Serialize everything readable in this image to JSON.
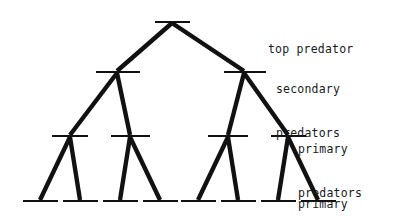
{
  "figure": {
    "kind": "trophic-pyramid-food-web-diagram",
    "background_color": "#ffffff",
    "ink_color": "#111111",
    "width": 419,
    "height": 216
  },
  "labels": {
    "top_predator": {
      "line1": "top predator"
    },
    "secondary_predators": {
      "line1": "secondary",
      "line2": "predators"
    },
    "primary_predators": {
      "line1": "primary",
      "line2": "predators"
    },
    "primary_producers": {
      "line1": "primary",
      "line2": "producers"
    }
  },
  "chart_data": {
    "type": "diagram",
    "title": "",
    "levels": [
      {
        "name": "top predator",
        "index": 0,
        "y": 22,
        "node_count": 1,
        "nodes": [
          {
            "id": "T1",
            "x_center": 172,
            "bar_x1": 155,
            "bar_x2": 190
          }
        ]
      },
      {
        "name": "secondary predators",
        "index": 1,
        "y": 72,
        "node_count": 2,
        "nodes": [
          {
            "id": "S1",
            "x_center": 117,
            "bar_x1": 96,
            "bar_x2": 140
          },
          {
            "id": "S2",
            "x_center": 244,
            "bar_x1": 224,
            "bar_x2": 266
          }
        ]
      },
      {
        "name": "primary predators",
        "index": 2,
        "y": 136,
        "node_count": 4,
        "nodes": [
          {
            "id": "P1",
            "x_center": 70,
            "bar_x1": 52,
            "bar_x2": 88
          },
          {
            "id": "P2",
            "x_center": 130,
            "bar_x1": 111,
            "bar_x2": 150
          },
          {
            "id": "P3",
            "x_center": 228,
            "bar_x1": 208,
            "bar_x2": 248
          },
          {
            "id": "P4",
            "x_center": 288,
            "bar_x1": 271,
            "bar_x2": 306
          }
        ]
      },
      {
        "name": "primary producers",
        "index": 3,
        "y": 201,
        "node_count": 8,
        "nodes": [
          {
            "id": "B1",
            "x_center": 40,
            "bar_x1": 23,
            "bar_x2": 58
          },
          {
            "id": "B2",
            "x_center": 80,
            "bar_x1": 63,
            "bar_x2": 98
          },
          {
            "id": "B3",
            "x_center": 120,
            "bar_x1": 103,
            "bar_x2": 138
          },
          {
            "id": "B4",
            "x_center": 160,
            "bar_x1": 143,
            "bar_x2": 178
          },
          {
            "id": "B5",
            "x_center": 198,
            "bar_x1": 181,
            "bar_x2": 216
          },
          {
            "id": "B6",
            "x_center": 238,
            "bar_x1": 221,
            "bar_x2": 256
          },
          {
            "id": "B7",
            "x_center": 278,
            "bar_x1": 261,
            "bar_x2": 296
          },
          {
            "id": "B8",
            "x_center": 318,
            "bar_x1": 301,
            "bar_x2": 336
          }
        ]
      }
    ],
    "edges": [
      {
        "from": "T1",
        "to": "S1"
      },
      {
        "from": "T1",
        "to": "S2"
      },
      {
        "from": "S1",
        "to": "P1"
      },
      {
        "from": "S1",
        "to": "P2"
      },
      {
        "from": "S2",
        "to": "P3"
      },
      {
        "from": "S2",
        "to": "P4"
      },
      {
        "from": "P1",
        "to": "B1"
      },
      {
        "from": "P1",
        "to": "B2"
      },
      {
        "from": "P2",
        "to": "B3"
      },
      {
        "from": "P2",
        "to": "B4"
      },
      {
        "from": "P3",
        "to": "B5"
      },
      {
        "from": "P3",
        "to": "B6"
      },
      {
        "from": "P4",
        "to": "B7"
      },
      {
        "from": "P4",
        "to": "B8"
      }
    ]
  }
}
